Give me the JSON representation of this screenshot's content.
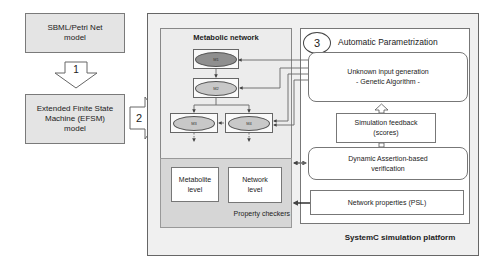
{
  "left": {
    "sbml_box": {
      "label": "SBML/Petri Net model"
    },
    "step1": {
      "label": "1"
    },
    "efsm_box": {
      "label": "Extended Finite State Machine (EFSM) model"
    },
    "step2": {
      "label": "2"
    }
  },
  "platform": {
    "label": "SystemC simulation platform",
    "metabolic_network": {
      "title": "Metabolic network",
      "nodes": [
        {
          "id": "M1",
          "label": "M1",
          "color": "#8f8f8f"
        },
        {
          "id": "M2",
          "label": "M2",
          "color": "#c8c8c8"
        },
        {
          "id": "M3",
          "label": "M3",
          "color": "#c8c8c8"
        },
        {
          "id": "M4",
          "label": "M4",
          "color": "#c8c8c8"
        }
      ]
    },
    "property_checkers": {
      "label": "Property checkers",
      "items": [
        {
          "label": "Metabolite level"
        },
        {
          "label": "Network level"
        }
      ]
    },
    "automatic_parametrization": {
      "step3": "3",
      "title": "Automatic Parametrization",
      "input_generation": {
        "line1": "Unknown input generation",
        "line2": "- Genetic Algorithm -"
      },
      "feedback": {
        "line1": "Simulation feedback",
        "line2": "(scores)"
      },
      "assertion": {
        "line1": "Dynamic Assertion-based",
        "line2": "verification"
      },
      "properties": {
        "label": "Network properties (PSL)"
      }
    }
  }
}
